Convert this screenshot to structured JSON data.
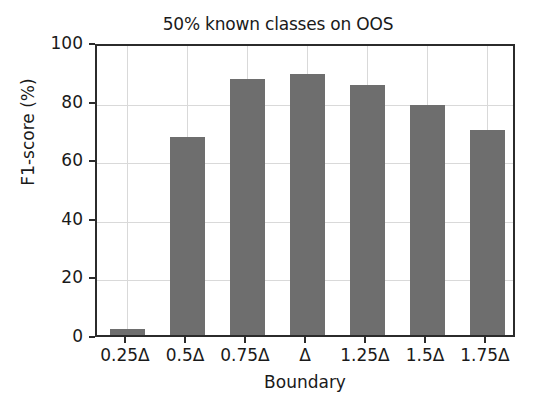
{
  "chart_data": {
    "type": "bar",
    "title": "50% known classes on OOS",
    "xlabel": "Boundary",
    "ylabel": "F1-score (%)",
    "categories": [
      "0.25Δ",
      "0.5Δ",
      "0.75Δ",
      "Δ",
      "1.25Δ",
      "1.5Δ",
      "1.75Δ"
    ],
    "values": [
      2,
      67.5,
      87.5,
      89,
      85.5,
      78.5,
      70
    ],
    "ylim": [
      0,
      100
    ],
    "yticks": [
      0,
      20,
      40,
      60,
      80,
      100
    ],
    "ytick_labels": [
      "0",
      "20",
      "40",
      "60",
      "80",
      "100"
    ],
    "grid": true,
    "legend": "none",
    "bar_color": "#6e6e6e",
    "axis_color": "#2b2b2b",
    "grid_color": "#d9d9d9"
  }
}
